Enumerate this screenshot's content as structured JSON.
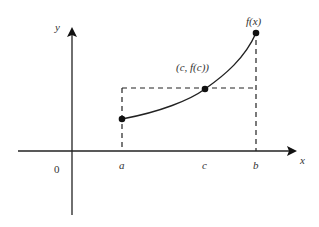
{
  "diagram": {
    "axes": {
      "x_label": "x",
      "y_label": "y",
      "origin_label": "0"
    },
    "tick_labels": {
      "a": "a",
      "c": "c",
      "b": "b"
    },
    "point_labels": {
      "end_point": "f(x)",
      "mean_point": "(c, f(c))"
    },
    "colors": {
      "ink": "#222222",
      "text": "#333333",
      "background": "#ffffff"
    }
  }
}
